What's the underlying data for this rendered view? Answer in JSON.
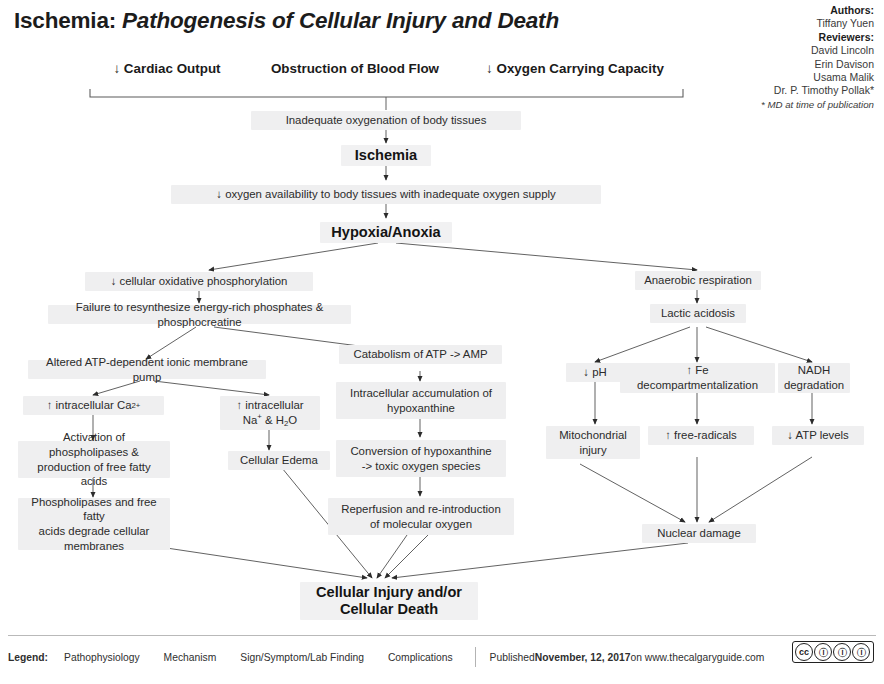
{
  "title": {
    "main": "Ischemia: ",
    "sub": "Pathogenesis of Cellular Injury and Death"
  },
  "credits": {
    "authors_label": "Authors:",
    "authors": [
      "Tiffany Yuen"
    ],
    "reviewers_label": "Reviewers:",
    "reviewers": [
      "David Lincoln",
      "Erin Davison",
      "Usama Malik",
      "Dr. P. Timothy Pollak*"
    ],
    "note": "* MD at time of publication"
  },
  "nodes": {
    "cardiac_output": "↓ Cardiac Output",
    "obstruction": "Obstruction of Blood Flow",
    "oxygen_capacity": "↓ Oxygen Carrying Capacity",
    "inadequate_oxygenation": "Inadequate oxygenation of body tissues",
    "ischemia": "Ischemia",
    "oxygen_availability": "↓ oxygen availability to body tissues with inadequate oxygen supply",
    "hypoxia_anoxia": "Hypoxia/Anoxia",
    "oxidative_phos": "↓ cellular oxidative phosphorylation",
    "anaerobic_respiration": "Anaerobic respiration",
    "failure_resynthesize": "Failure to resynthesize energy-rich phosphates & phosphocreatine",
    "lactic_acidosis": "Lactic acidosis",
    "altered_pump": "Altered ATP-dependent ionic membrane pump",
    "catabolism_atp": "Catabolism of ATP -> AMP",
    "low_ph": "↓ pH",
    "fe_decomp_line1": "↑ Fe",
    "fe_decomp_line2": "decompartmentalization",
    "nadh_line1": "NADH",
    "nadh_line2": "degradation",
    "intracellular_ca": "↑ intracellular Ca",
    "intracellular_ca_sup": "2+",
    "intracellular_na_line1": "↑ intracellular",
    "intracellular_na_line2_a": "Na",
    "intracellular_na_line2_sup": "+",
    "intracellular_na_line2_b": " & H",
    "intracellular_na_line2_sub": "2",
    "intracellular_na_line2_c": "O",
    "hypoxanthine_accum_line1": "Intracellular accumulation of",
    "hypoxanthine_accum_line2": "hypoxanthine",
    "mito_injury_line1": "Mitochondrial",
    "mito_injury_line2": "injury",
    "free_radicals": "↑ free-radicals",
    "atp_levels": "↓ ATP levels",
    "phospholipase_activation_line1": "Activation of phospholipases &",
    "phospholipase_activation_line2": "production of free fatty acids",
    "cellular_edema": "Cellular Edema",
    "conversion_hypo_line1": "Conversion of hypoxanthine",
    "conversion_hypo_line2": "-> toxic oxygen species",
    "degrade_membranes_line1": "Phospholipases and free fatty",
    "degrade_membranes_line2": "acids degrade cellular",
    "degrade_membranes_line3": "membranes",
    "reperfusion_line1": "Reperfusion and re-introduction",
    "reperfusion_line2": "of molecular oxygen",
    "nuclear_damage": "Nuclear damage",
    "cellular_injury_line1": "Cellular Injury and/or",
    "cellular_injury_line2": "Cellular Death"
  },
  "footer": {
    "legend_label": "Legend:",
    "legend_items": [
      "Pathophysiology",
      "Mechanism",
      "Sign/Symptom/Lab Finding",
      "Complications"
    ],
    "published_prefix": "Published ",
    "published_date": "November, 12, 2017",
    "published_suffix": " on www.thecalgaryguide.com",
    "cc_marks": [
      "cc",
      "ⓘ",
      "ⓘ",
      "ⓘ"
    ]
  },
  "colors": {
    "node_bg": "#efeff0",
    "text": "#2b2b2b",
    "wire": "#5a5a5a",
    "rule": "#b9b9b9"
  }
}
